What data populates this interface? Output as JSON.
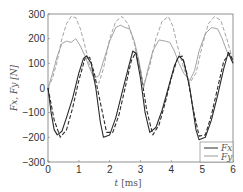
{
  "chart_data": {
    "type": "line",
    "title": "",
    "xlabel": "t [ms]",
    "ylabel": "Fx, Fy [N]",
    "xlim": [
      0,
      6
    ],
    "ylim": [
      -300,
      300
    ],
    "xticks": [
      0,
      1,
      2,
      3,
      4,
      5,
      6
    ],
    "yticks": [
      -300,
      -200,
      -100,
      0,
      100,
      200,
      300
    ],
    "grid": false,
    "legend_position": "lower right",
    "legend": [
      "Fx",
      "Fy"
    ],
    "series": [
      {
        "name": "Fx",
        "style": "solid dark",
        "x": [
          0,
          0.1,
          0.2,
          0.3,
          0.45,
          0.6,
          0.8,
          1.0,
          1.15,
          1.25,
          1.4,
          1.55,
          1.7,
          1.8,
          2.0,
          2.2,
          2.4,
          2.6,
          2.75,
          2.85,
          3.0,
          3.15,
          3.3,
          3.5,
          3.7,
          3.9,
          4.1,
          4.25,
          4.4,
          4.6,
          4.8,
          4.9,
          5.1,
          5.3,
          5.5,
          5.7,
          5.85,
          6.0
        ],
        "y": [
          0,
          -100,
          -170,
          -190,
          -175,
          -120,
          -40,
          60,
          120,
          130,
          100,
          0,
          -140,
          -200,
          -190,
          -120,
          -20,
          80,
          150,
          140,
          40,
          -100,
          -180,
          -160,
          -90,
          0,
          90,
          130,
          110,
          0,
          -170,
          -210,
          -200,
          -130,
          -30,
          80,
          145,
          100
        ]
      },
      {
        "name": "Fx (reference)",
        "style": "dashed dark",
        "x": [
          0,
          0.2,
          0.4,
          0.6,
          0.8,
          1.0,
          1.2,
          1.35,
          1.5,
          1.7,
          1.9,
          2.1,
          2.3,
          2.5,
          2.7,
          2.85,
          3.0,
          3.2,
          3.4,
          3.6,
          3.8,
          4.0,
          4.2,
          4.35,
          4.5,
          4.7,
          4.9,
          5.1,
          5.3,
          5.5,
          5.7,
          5.9,
          6.0
        ],
        "y": [
          0,
          -130,
          -200,
          -170,
          -80,
          30,
          120,
          125,
          60,
          -60,
          -180,
          -180,
          -110,
          0,
          110,
          145,
          70,
          -90,
          -190,
          -150,
          -60,
          40,
          120,
          130,
          60,
          -80,
          -195,
          -190,
          -110,
          0,
          110,
          140,
          110
        ]
      },
      {
        "name": "Fy",
        "style": "solid light",
        "x": [
          0,
          0.15,
          0.3,
          0.45,
          0.6,
          0.75,
          0.9,
          1.05,
          1.2,
          1.35,
          1.5,
          1.65,
          1.8,
          2.0,
          2.2,
          2.35,
          2.5,
          2.65,
          2.8,
          2.95,
          3.1,
          3.25,
          3.4,
          3.6,
          3.8,
          3.95,
          4.1,
          4.25,
          4.4,
          4.6,
          4.75,
          4.9,
          5.1,
          5.3,
          5.5,
          5.65,
          5.8,
          6.0
        ],
        "y": [
          0,
          60,
          130,
          180,
          190,
          185,
          200,
          170,
          130,
          80,
          40,
          50,
          110,
          190,
          245,
          255,
          245,
          240,
          190,
          110,
          0,
          80,
          150,
          195,
          190,
          185,
          150,
          100,
          60,
          30,
          70,
          150,
          220,
          245,
          240,
          200,
          150,
          100
        ]
      },
      {
        "name": "Fy (reference)",
        "style": "dashed light",
        "x": [
          0,
          0.15,
          0.3,
          0.45,
          0.6,
          0.75,
          0.9,
          1.05,
          1.2,
          1.35,
          1.5,
          1.65,
          1.8,
          2.0,
          2.2,
          2.4,
          2.6,
          2.8,
          3.0,
          3.1,
          3.3,
          3.5,
          3.7,
          3.9,
          4.05,
          4.2,
          4.4,
          4.6,
          4.8,
          5.0,
          5.2,
          5.4,
          5.6,
          5.8,
          6.0
        ],
        "y": [
          0,
          40,
          110,
          200,
          260,
          290,
          285,
          240,
          170,
          90,
          30,
          20,
          80,
          200,
          270,
          290,
          260,
          180,
          60,
          10,
          90,
          200,
          270,
          290,
          250,
          170,
          80,
          20,
          60,
          170,
          260,
          290,
          275,
          200,
          110
        ]
      }
    ]
  },
  "axes": {
    "xlabel_t": "t",
    "xlabel_unit": "[ms]",
    "ylabel_text": "Fx, Fy [N]",
    "legend_fx": "Fx",
    "legend_fy": "Fy"
  },
  "colors": {
    "fx": "#2a2a2a",
    "fy": "#9a9a9a",
    "axes": "#555555"
  }
}
